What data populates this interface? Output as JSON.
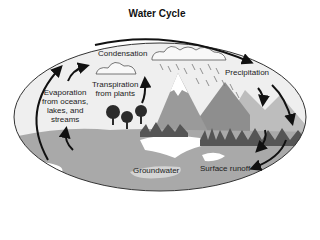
{
  "title": "Water Cycle",
  "labels": {
    "condensation": "Condensation",
    "transpiration_line1": "Transpiration",
    "transpiration_line2": "from plants",
    "evaporation_line1": "Evaporation",
    "evaporation_line2": "from oceans,",
    "evaporation_line3": "lakes, and",
    "evaporation_line4": "streams",
    "precipitation": "Precipitation",
    "groundwater": "Groundwater",
    "surface_runoff": "Surface runoff"
  },
  "colors": {
    "sky": "#efefef",
    "land": "#a9a9a9",
    "mountain_light": "#bcbcbc",
    "mountain_dark": "#8e8e8e",
    "water": "#ffffff",
    "arrow": "#111111",
    "trees": "#2b2b2b"
  }
}
